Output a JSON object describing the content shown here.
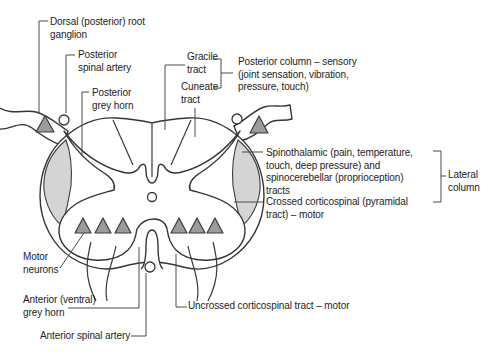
{
  "colors": {
    "background": "#ffffff",
    "line": "#353535",
    "text": "#1d1d1d",
    "shade_fill": "#d4d4d4",
    "neuron_fill": "#9b9b9b"
  },
  "labels": {
    "dorsal_root_ganglion": "Dorsal (posterior) root\nganglion",
    "posterior_spinal_artery": "Posterior\nspinal artery",
    "posterior_grey_horn": "Posterior\ngrey horn",
    "gracile_tract": "Gracile\ntract",
    "cuneate_tract": "Cuneate\ntract",
    "posterior_column": "Posterior column – sensory\n(joint sensation, vibration,\npressure, touch)",
    "spinothalamic": "Spinothalamic (pain, temperature,\ntouch, deep pressure) and\nspinocerebellar (proprioception)\ntracts",
    "crossed_corticospinal": "Crossed corticospinal (pyramidal\ntract) – motor",
    "lateral_column": "Lateral\ncolumn",
    "motor_neurons": "Motor\nneurons",
    "anterior_grey_horn": "Anterior (ventral)\ngrey horn",
    "anterior_spinal_artery": "Anterior spinal artery",
    "uncrossed_corticospinal": "Uncrossed corticospinal tract – motor"
  }
}
